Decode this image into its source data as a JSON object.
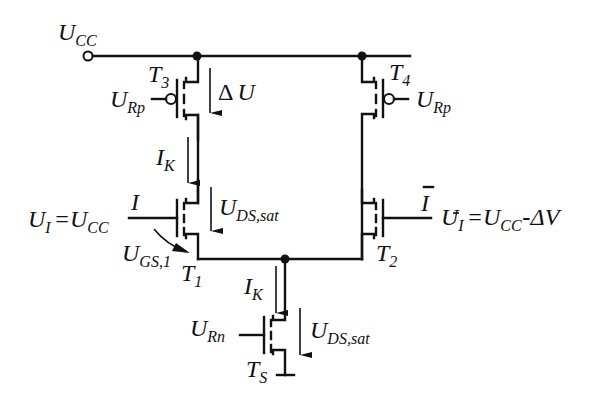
{
  "diagram": {
    "supply": {
      "main": "U",
      "sub": "CC"
    },
    "transistors": {
      "T3": {
        "main": "T",
        "sub": "3",
        "gate": {
          "main": "U",
          "sub": "Rp"
        }
      },
      "T4": {
        "main": "T",
        "sub": "4",
        "gate": {
          "main": "U",
          "sub": "Rp"
        }
      },
      "T1": {
        "main": "T",
        "sub": "1",
        "gate_signal": "I"
      },
      "T2": {
        "main": "T",
        "sub": "2",
        "gate_signal": "I"
      },
      "TS": {
        "main": "T",
        "sub": "S",
        "gate": {
          "main": "U",
          "sub": "Rn"
        }
      }
    },
    "labels": {
      "delta_u": {
        "prefix": "Δ",
        "main": "U"
      },
      "ik_upper": {
        "main": "I",
        "sub": "K"
      },
      "ik_lower": {
        "main": "I",
        "sub": "K"
      },
      "uds_sat_t1": {
        "main": "U",
        "sub": "DS,sat"
      },
      "uds_sat_ts": {
        "main": "U",
        "sub": "DS,sat"
      },
      "ugs_1": {
        "main": "U",
        "sub": "GS,1"
      },
      "ui_eq": {
        "left_main": "U",
        "left_sub": "I",
        "eq": "=",
        "right_main": "U",
        "right_sub": "CC"
      },
      "uibar_eq": {
        "left_main": "U",
        "left_sub": "I",
        "eq": "=",
        "right_main": "U",
        "right_sub": "CC",
        "minus": "-",
        "delta": "Δ",
        "tail": "V"
      }
    }
  }
}
